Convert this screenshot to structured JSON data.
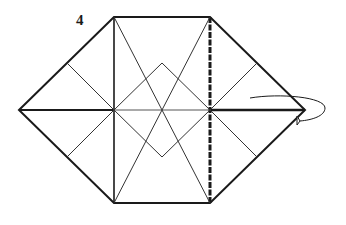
{
  "diagram": {
    "step_number": "4",
    "colors": {
      "line": "#1a1a1a",
      "crease": "#444444",
      "background": "#ffffff"
    }
  }
}
